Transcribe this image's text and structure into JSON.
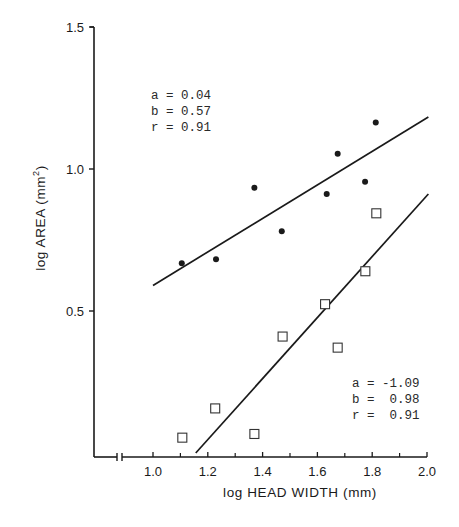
{
  "chart_data": {
    "type": "scatter",
    "title": "",
    "xlabel": "log HEAD WIDTH (mm)",
    "ylabel": "log AREA (mm²)",
    "ylabel_parts": {
      "base": "log AREA (mm",
      "sup": "2",
      "close": ")"
    },
    "xlim": [
      0.85,
      2.0
    ],
    "ylim": [
      0.0,
      1.5
    ],
    "x_axis_break": true,
    "x_ticks": [
      1.0,
      1.2,
      1.4,
      1.6,
      1.8,
      2.0
    ],
    "x_tick_labels": [
      "1.0",
      "1.2",
      "1.4",
      "1.6",
      "1.8",
      "2.0"
    ],
    "x_minor_ticks": [
      1.1,
      1.3,
      1.5,
      1.7,
      1.9
    ],
    "y_ticks": [
      0.5,
      1.0,
      1.5
    ],
    "y_tick_labels": [
      "0.5",
      "1.0",
      "1.5"
    ],
    "grid": false,
    "series": [
      {
        "name": "filled circles",
        "marker": "filled-circle",
        "points": [
          {
            "x": 1.105,
            "y": 0.668
          },
          {
            "x": 1.23,
            "y": 0.682
          },
          {
            "x": 1.37,
            "y": 0.934
          },
          {
            "x": 1.47,
            "y": 0.781
          },
          {
            "x": 1.634,
            "y": 0.912
          },
          {
            "x": 1.674,
            "y": 1.054
          },
          {
            "x": 1.774,
            "y": 0.955
          },
          {
            "x": 1.813,
            "y": 1.164
          }
        ],
        "fit_line": {
          "x0": 1.0,
          "y0": 0.59,
          "x1": 2.005,
          "y1": 1.183
        },
        "stats": {
          "a": "0.04",
          "b": "0.57",
          "r": "0.91"
        }
      },
      {
        "name": "open squares",
        "marker": "open-square",
        "points": [
          {
            "x": 1.107,
            "y": 0.054
          },
          {
            "x": 1.227,
            "y": 0.157
          },
          {
            "x": 1.37,
            "y": 0.067
          },
          {
            "x": 1.473,
            "y": 0.41
          },
          {
            "x": 1.628,
            "y": 0.524
          },
          {
            "x": 1.674,
            "y": 0.371
          },
          {
            "x": 1.775,
            "y": 0.64
          },
          {
            "x": 1.815,
            "y": 0.844
          }
        ],
        "fit_line": {
          "x0": 1.156,
          "y0": 0.0,
          "x1": 2.005,
          "y1": 0.912
        },
        "stats": {
          "a": "-1.09",
          "b": "0.98",
          "r": "0.91"
        }
      }
    ],
    "annotations": [
      {
        "series": 0,
        "lines": [
          "a = 0.04",
          "b = 0.57",
          "r = 0.91"
        ]
      },
      {
        "series": 1,
        "lines": [
          "a = -1.09",
          "b =  0.98",
          "r =  0.91"
        ]
      }
    ]
  },
  "colors": {
    "ink": "#1a1a1a",
    "background": "#ffffff"
  }
}
